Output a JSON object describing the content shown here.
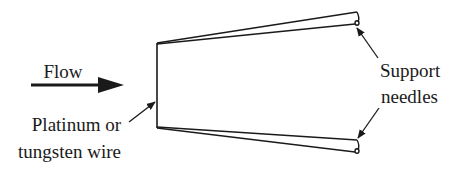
{
  "diagram": {
    "type": "hot-wire anemometer probe schematic",
    "colors": {
      "stroke": "#1a1a1a",
      "background": "#ffffff"
    },
    "labels": {
      "flow": "Flow",
      "wire_line1": "Platinum or",
      "wire_line2": "tungsten wire",
      "needles_line1": "Support",
      "needles_line2": "needles"
    },
    "components": [
      {
        "id": "flow-arrow",
        "kind": "arrow",
        "direction": "right"
      },
      {
        "id": "sensing-wire",
        "kind": "line",
        "orientation": "vertical"
      },
      {
        "id": "support-needle-top",
        "kind": "needle"
      },
      {
        "id": "support-needle-bottom",
        "kind": "needle"
      }
    ]
  }
}
